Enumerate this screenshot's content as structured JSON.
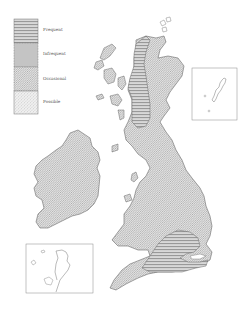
{
  "legend": {
    "items": [
      {
        "label": "Frequent",
        "pattern": "horizontal-stripes"
      },
      {
        "label": "Infrequent",
        "pattern": "fine-crosshatch"
      },
      {
        "label": "Occasional",
        "pattern": "diagonal-hatch"
      },
      {
        "label": "Possible",
        "pattern": "stipple"
      }
    ]
  },
  "map": {
    "regions": [
      "Scotland",
      "England",
      "Wales",
      "Ireland",
      "Orkney",
      "Hebrides"
    ],
    "insets": [
      {
        "name": "shetland-inset"
      },
      {
        "name": "channel-islands-inset"
      }
    ]
  },
  "colors": {
    "outline": "#6a6a6a",
    "hatch": "#9a9a9a",
    "background": "#ffffff"
  }
}
